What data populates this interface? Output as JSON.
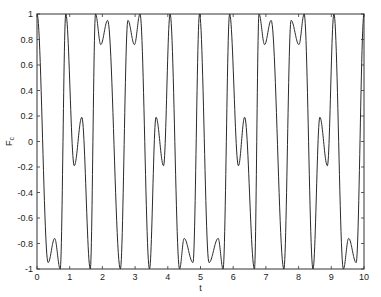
{
  "chart_data": {
    "type": "line",
    "title": "",
    "xlabel": "t",
    "ylabel": "F",
    "ylabel_subscript": "c",
    "xlim": [
      0,
      10
    ],
    "ylim": [
      -1,
      1
    ],
    "grid": false,
    "legend": "none",
    "x_ticks": [
      0,
      1,
      2,
      3,
      4,
      5,
      6,
      7,
      8,
      9,
      10
    ],
    "x_tick_labels": [
      "0",
      "1",
      "2",
      "3",
      "4",
      "5",
      "6",
      "7",
      "8",
      "9",
      "10"
    ],
    "y_ticks": [
      -1,
      -0.8,
      -0.6,
      -0.4,
      -0.2,
      0,
      0.2,
      0.4,
      0.6,
      0.8,
      1
    ],
    "y_tick_labels": [
      "-1",
      "-0.8",
      "-0.6",
      "-0.4",
      "-0.2",
      "0",
      "0.2",
      "0.4",
      "0.6",
      "0.8",
      "1"
    ],
    "series": [
      {
        "name": "F_c",
        "color": "#2a2a2a",
        "extrema_t": [
          0,
          0.34,
          0.54,
          0.71,
          0.88,
          1.14,
          1.37,
          1.63,
          1.79,
          1.95,
          2.16,
          2.55,
          2.78,
          2.98,
          3.15,
          3.44,
          3.64,
          3.87,
          4.07,
          4.36,
          4.5,
          4.77,
          4.97,
          5.26,
          5.54,
          5.69,
          5.89,
          6.16,
          6.35,
          6.65,
          6.79,
          6.96,
          7.16,
          7.55,
          7.77,
          8.01,
          8.17,
          8.44,
          8.65,
          8.88,
          9.08,
          9.37,
          9.53,
          9.76,
          10.0
        ],
        "extrema_F": [
          1,
          -0.95,
          -0.76,
          -1,
          1,
          -0.19,
          0.19,
          -1,
          1,
          0.76,
          0.95,
          -1,
          0.95,
          0.76,
          1,
          -1,
          0.19,
          -0.19,
          1,
          -1,
          -0.76,
          -0.95,
          1,
          -0.95,
          -0.76,
          -1,
          1,
          -0.19,
          0.19,
          -1,
          1,
          0.76,
          0.95,
          -1,
          0.95,
          0.76,
          1,
          -1,
          0.19,
          -0.19,
          1,
          -1,
          -0.76,
          -0.95,
          1
        ]
      }
    ]
  }
}
